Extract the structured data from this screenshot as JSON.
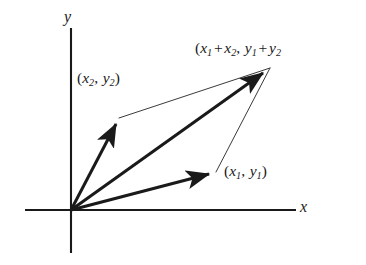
{
  "figure": {
    "kind": "vector-addition-parallelogram-diagram",
    "background_color": "#ffffff",
    "ink_color": "#1a1a1a",
    "width": 366,
    "height": 265,
    "axes": {
      "x_axis_label": "x",
      "y_axis_label": "y",
      "origin": {
        "x": 71,
        "y": 210
      },
      "x_axis": {
        "x1": 25,
        "y1": 210,
        "x2": 296,
        "y2": 210
      },
      "y_axis": {
        "x1": 71,
        "y1": 28,
        "x2": 71,
        "y2": 253
      },
      "axis_stroke_width": 2.1
    },
    "labels": {
      "sum": {
        "open_paren": "(",
        "x_base": "x",
        "x_sub_1": "1",
        "plus_1": "+",
        "x2_base": "x",
        "x2_sub": "2",
        "comma": ",",
        "y_base": "y",
        "y_sub_1": "1",
        "plus_2": "+",
        "y2_base": "y",
        "y2_sub": "2",
        "plain": "(x1 + x2,  y1 + y2",
        "note_clipped_right_edge": true
      },
      "v2": {
        "open_paren": "(",
        "x_base": "x",
        "x_sub": "2",
        "comma": ",",
        "y_base": "y",
        "y_sub": "2",
        "close_paren": ")",
        "plain": "(x2,  y2)"
      },
      "v1": {
        "open_paren": "(",
        "x_base": "x",
        "x_sub": "1",
        "comma": ",",
        "y_base": "y",
        "y_sub": "1",
        "close_paren": ")",
        "plain": "(x1,  y1)"
      }
    },
    "vectors": [
      {
        "name": "vector-v2",
        "label_key": "v2",
        "from": {
          "x": 71,
          "y": 210
        },
        "to": {
          "x": 119,
          "y": 118
        },
        "style": "thick-arrow",
        "stroke_width": 3.0,
        "arrowhead": true
      },
      {
        "name": "vector-v1",
        "label_key": "v1",
        "from": {
          "x": 71,
          "y": 210
        },
        "to": {
          "x": 216,
          "y": 172
        },
        "style": "thick-arrow",
        "stroke_width": 3.0,
        "arrowhead": true
      },
      {
        "name": "vector-sum",
        "label_key": "sum",
        "from": {
          "x": 71,
          "y": 210
        },
        "to": {
          "x": 270,
          "y": 68
        },
        "style": "thick-arrow",
        "stroke_width": 3.0,
        "arrowhead": true
      }
    ],
    "parallelogram_sides": [
      {
        "name": "side-from-v2-to-sum",
        "from": {
          "x": 119,
          "y": 118
        },
        "to": {
          "x": 270,
          "y": 68
        },
        "style": "thin-line",
        "stroke_width": 1.0
      },
      {
        "name": "side-from-v1-to-sum",
        "from": {
          "x": 216,
          "y": 172
        },
        "to": {
          "x": 270,
          "y": 68
        },
        "style": "thin-line",
        "stroke_width": 1.0
      }
    ]
  }
}
